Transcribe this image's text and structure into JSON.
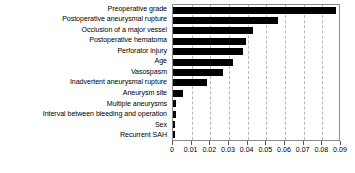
{
  "chart_data": {
    "type": "bar",
    "orientation": "horizontal",
    "title": "",
    "xlabel": "",
    "ylabel": "",
    "xlim": [
      0,
      0.09
    ],
    "xticks": [
      0,
      0.01,
      0.02,
      0.03,
      0.04,
      0.05,
      0.06,
      0.07,
      0.08,
      0.09
    ],
    "xtick_labels": [
      "0",
      "0.01",
      "0.02",
      "0.03",
      "0.04",
      "0.05",
      "0.06",
      "0.07",
      "0.08",
      "0.09"
    ],
    "grid": true,
    "grid_axis": "x",
    "grid_style": "dashed",
    "legend": false,
    "bar_color": "#000000",
    "categories": [
      "Preoperative grade",
      "Postoperative aneurysmal rupture",
      "Occlusion of a major vessel",
      "Postoperative hematoma",
      "Perforator injury",
      "Age",
      "Vasospasm",
      "Inadvertent aneurysmal rupture",
      "Aneurysm site",
      "Multiple aneurysms",
      "Interval between bleeding and operation",
      "Sex",
      "Recurrent SAH"
    ],
    "values": [
      0.0872,
      0.0562,
      0.0428,
      0.039,
      0.0377,
      0.032,
      0.0268,
      0.0182,
      0.0055,
      0.0018,
      0.0016,
      0.0012,
      0.0009
    ]
  },
  "colors": {
    "bar": "#000000",
    "frame": "#8a8a8a",
    "grid": "#b9b9b9",
    "text": "#000000",
    "background": "#ffffff"
  }
}
